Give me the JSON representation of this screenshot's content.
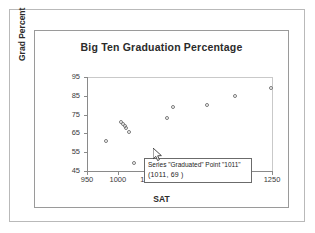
{
  "chart": {
    "title": "Big Ten Graduation Percentage",
    "xlabel": "SAT",
    "ylabel": "Grad Percent"
  },
  "tooltip": {
    "line1": "Series \"Graduated\" Point \"1011\"",
    "line2": "(1011,  69 )",
    "cursor_icon": "mouse-pointer-icon"
  },
  "chart_data": {
    "type": "scatter",
    "title": "Big Ten Graduation Percentage",
    "xlabel": "SAT",
    "ylabel": "Grad Percent",
    "xlim": [
      950,
      1250
    ],
    "ylim": [
      45,
      95
    ],
    "xticks": [
      950,
      1000,
      1050,
      1100,
      1150,
      1200,
      1250
    ],
    "yticks": [
      45,
      55,
      65,
      75,
      85,
      95
    ],
    "grid": false,
    "legend": "none",
    "series": [
      {
        "name": "Graduated",
        "marker": "open-circle",
        "points": [
          {
            "x": 981,
            "y": 61
          },
          {
            "x": 1005,
            "y": 71
          },
          {
            "x": 1008,
            "y": 70
          },
          {
            "x": 1011,
            "y": 69
          },
          {
            "x": 1014,
            "y": 68
          },
          {
            "x": 1018,
            "y": 66
          },
          {
            "x": 1027,
            "y": 49
          },
          {
            "x": 1080,
            "y": 73
          },
          {
            "x": 1089,
            "y": 79
          },
          {
            "x": 1145,
            "y": 80
          },
          {
            "x": 1190,
            "y": 85
          },
          {
            "x": 1248,
            "y": 89
          }
        ]
      }
    ],
    "annotations": [
      {
        "type": "tooltip",
        "text": "Series \"Graduated\" Point \"1011\" (1011,  69 )",
        "at": {
          "x": 1011,
          "y": 69
        }
      }
    ]
  },
  "colors": {
    "marker_stroke": "#7a7a7a",
    "axis": "#8a8a8a",
    "text": "#2b2b2b",
    "frame_outer": "#b9b9b9",
    "frame_inner": "#9a9a9a"
  }
}
